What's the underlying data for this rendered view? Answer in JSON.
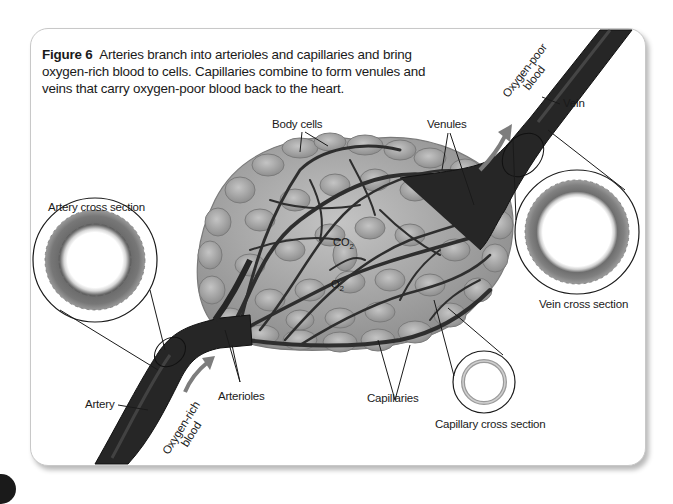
{
  "figure": {
    "label": "Figure 6",
    "caption": "Arteries branch into arterioles and capillaries and bring oxygen-rich blood to cells. Capillaries combine to form venules and veins that carry oxygen-poor blood back to the heart."
  },
  "labels": {
    "body_cells": "Body cells",
    "venules": "Venules",
    "vein": "Vein",
    "artery_cross_section": "Artery cross section",
    "vein_cross_section": "Vein cross section",
    "capillary_cross_section": "Capillary cross section",
    "artery": "Artery",
    "arterioles": "Arterioles",
    "capillaries": "Capillaries",
    "oxygen_poor_line1": "Oxygen-poor",
    "oxygen_poor_line2": "blood",
    "oxygen_rich_line1": "Oxygen-rich",
    "oxygen_rich_line2": "blood",
    "co2_base": "CO",
    "co2_sub": "2",
    "o2_base": "O",
    "o2_sub": "2"
  },
  "colors": {
    "vessel": "#2b2b2b",
    "cell_fill": "#a9a9a9",
    "cell_stroke": "#7a7a7a",
    "arrow": "#7d7d7d",
    "text": "#1a1a1a"
  }
}
